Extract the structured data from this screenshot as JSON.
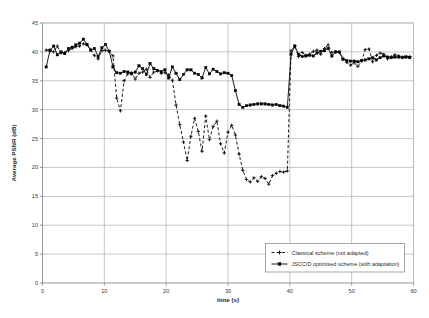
{
  "chart_data": {
    "type": "line",
    "title": "",
    "xlabel": "time (s)",
    "ylabel": "Average PSNR (dB)",
    "xlim": [
      0,
      60
    ],
    "ylim": [
      0,
      45
    ],
    "xticks": [
      0,
      10,
      20,
      30,
      40,
      50,
      60
    ],
    "yticks": [
      0,
      5,
      10,
      15,
      20,
      25,
      30,
      35,
      40,
      45
    ],
    "grid": true,
    "legend_position": "lower-right-inside",
    "series": [
      {
        "name": "Classical scheme (not adapted)",
        "line_style": "dashed",
        "marker": "cross",
        "color": "#000000",
        "x": [
          0.6,
          1.2,
          1.8,
          2.4,
          3.0,
          3.6,
          4.2,
          4.8,
          5.4,
          6.0,
          6.6,
          7.2,
          7.8,
          8.4,
          9.0,
          9.6,
          10.2,
          10.8,
          11.4,
          12.0,
          12.6,
          13.2,
          13.8,
          14.4,
          15.0,
          15.6,
          16.2,
          16.8,
          17.4,
          18.0,
          18.6,
          19.2,
          19.8,
          20.4,
          21.0,
          21.6,
          22.2,
          22.8,
          23.4,
          24.0,
          24.6,
          25.2,
          25.8,
          26.4,
          27.0,
          27.6,
          28.2,
          28.8,
          29.4,
          30.0,
          30.6,
          31.2,
          31.8,
          32.4,
          33.0,
          33.6,
          34.2,
          34.8,
          35.4,
          36.0,
          36.6,
          37.2,
          37.8,
          38.4,
          39.0,
          39.6,
          40.2,
          40.8,
          41.4,
          42.0,
          42.6,
          43.2,
          43.8,
          44.4,
          45.0,
          45.6,
          46.2,
          46.8,
          47.4,
          48.0,
          48.6,
          49.2,
          49.8,
          50.4,
          51.0,
          51.6,
          52.2,
          52.8,
          53.4,
          54.0,
          54.6,
          55.2,
          55.8,
          56.4,
          57.0,
          57.6,
          58.2,
          58.8,
          59.4
        ],
        "y": [
          40.3,
          40.4,
          40.0,
          41.0,
          39.8,
          39.9,
          40.2,
          40.6,
          40.9,
          41.0,
          41.4,
          41.2,
          40.4,
          39.4,
          38.8,
          40.2,
          40.3,
          40.1,
          39.3,
          32.0,
          29.8,
          35.0,
          36.2,
          36.4,
          35.3,
          36.3,
          36.5,
          37.0,
          35.6,
          36.5,
          36.7,
          36.3,
          36.4,
          36.0,
          35.1,
          30.8,
          27.4,
          24.4,
          21.2,
          25.4,
          28.5,
          26.2,
          22.8,
          28.9,
          24.8,
          27.1,
          28.0,
          24.1,
          22.5,
          26.1,
          27.3,
          25.6,
          22.3,
          19.5,
          17.9,
          17.5,
          18.2,
          17.6,
          18.4,
          18.1,
          17.1,
          18.6,
          19.0,
          19.3,
          19.2,
          19.4,
          40.2,
          41.0,
          39.2,
          39.9,
          39.4,
          39.6,
          40.1,
          40.3,
          39.6,
          40.6,
          41.2,
          39.9,
          40.0,
          39.9,
          38.9,
          38.2,
          37.7,
          38.1,
          37.5,
          38.4,
          40.4,
          40.5,
          38.3,
          39.4,
          39.8,
          39.6,
          38.8,
          39.2,
          39.5,
          39.3,
          39.1,
          39.2,
          39.2
        ]
      },
      {
        "name": "JSCC/D optimised scheme (with adaptation)",
        "line_style": "solid",
        "marker": "square",
        "color": "#000000",
        "x": [
          0.6,
          1.2,
          1.8,
          2.4,
          3.0,
          3.6,
          4.2,
          4.8,
          5.4,
          6.0,
          6.6,
          7.2,
          7.8,
          8.4,
          9.0,
          9.6,
          10.2,
          10.8,
          11.4,
          12.0,
          12.6,
          13.2,
          13.8,
          14.4,
          15.0,
          15.6,
          16.2,
          16.8,
          17.4,
          18.0,
          18.6,
          19.2,
          19.8,
          20.4,
          21.0,
          21.6,
          22.2,
          22.8,
          23.4,
          24.0,
          24.6,
          25.2,
          25.8,
          26.4,
          27.0,
          27.6,
          28.2,
          28.8,
          29.4,
          30.0,
          30.6,
          31.2,
          31.8,
          32.4,
          33.0,
          33.6,
          34.2,
          34.8,
          35.4,
          36.0,
          36.6,
          37.2,
          37.8,
          38.4,
          39.0,
          39.6,
          40.2,
          40.8,
          41.4,
          42.0,
          42.6,
          43.2,
          43.8,
          44.4,
          45.0,
          45.6,
          46.2,
          46.8,
          47.4,
          48.0,
          48.6,
          49.2,
          49.8,
          50.4,
          51.0,
          51.6,
          52.2,
          52.8,
          53.4,
          54.0,
          54.6,
          55.2,
          55.8,
          56.4,
          57.0,
          57.6,
          58.2,
          58.8,
          59.4
        ],
        "y": [
          37.4,
          40.2,
          41.0,
          39.5,
          40.0,
          39.7,
          40.6,
          40.8,
          41.2,
          41.5,
          42.2,
          41.3,
          40.3,
          40.6,
          39.2,
          40.7,
          41.3,
          40.1,
          37.4,
          36.4,
          36.3,
          36.6,
          36.5,
          36.2,
          36.5,
          37.6,
          37.1,
          36.1,
          38.0,
          37.1,
          36.8,
          36.6,
          36.9,
          35.5,
          37.4,
          36.3,
          35.2,
          36.1,
          36.9,
          36.9,
          36.3,
          36.1,
          35.5,
          37.3,
          36.2,
          37.0,
          36.6,
          36.2,
          36.4,
          36.3,
          35.9,
          33.3,
          30.9,
          30.4,
          30.7,
          30.8,
          30.9,
          31.0,
          31.0,
          31.0,
          30.9,
          30.8,
          30.9,
          30.7,
          30.6,
          30.4,
          39.6,
          41.0,
          39.6,
          39.2,
          39.3,
          39.4,
          39.3,
          39.8,
          40.1,
          40.2,
          40.6,
          39.3,
          40.0,
          40.0,
          38.7,
          38.5,
          38.4,
          38.4,
          38.3,
          38.5,
          38.6,
          38.8,
          39.0,
          38.6,
          39.0,
          39.3,
          39.1,
          39.0,
          39.1,
          39.1,
          39.0,
          39.1,
          39.0
        ]
      }
    ]
  },
  "axes": {
    "y_title": "Average PSNR (dB)",
    "x_title": "time (s)"
  },
  "legend": {
    "entries": [
      {
        "label": "Classical scheme (not adapted)"
      },
      {
        "label": "JSCC/D optimised scheme (with adaptation)"
      }
    ]
  }
}
